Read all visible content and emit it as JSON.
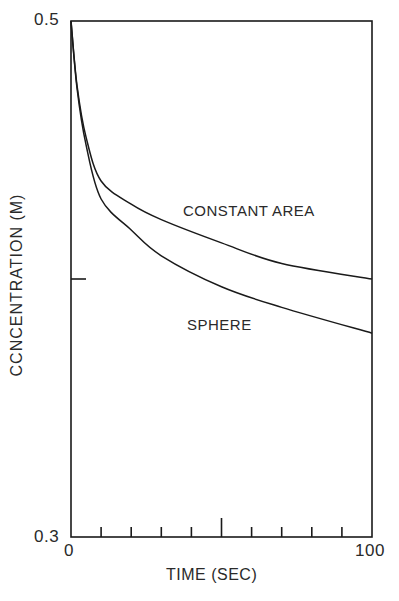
{
  "chart_data": {
    "type": "line",
    "title": "",
    "xlabel": "TIME (SEC)",
    "ylabel": "CCNCENTRATION (M)",
    "xlim": [
      0,
      100
    ],
    "ylim": [
      0.3,
      0.5
    ],
    "x_tick_labels": [
      "0",
      "100"
    ],
    "y_tick_labels": [
      "0.3",
      "0.5"
    ],
    "x_minor_ticks": [
      10,
      20,
      30,
      40,
      50,
      60,
      70,
      80,
      90
    ],
    "y_minor_ticks": [
      0.4
    ],
    "grid": false,
    "legend": "inline annotations",
    "x": [
      0,
      2,
      5,
      10,
      20,
      30,
      50,
      70,
      100
    ],
    "series": [
      {
        "name": "CONSTANT AREA",
        "values": [
          0.5,
          0.475,
          0.455,
          0.438,
          0.429,
          0.423,
          0.414,
          0.406,
          0.4
        ]
      },
      {
        "name": "SPHERE",
        "values": [
          0.5,
          0.474,
          0.452,
          0.431,
          0.419,
          0.409,
          0.397,
          0.389,
          0.379
        ]
      }
    ],
    "annotations": [
      {
        "text": "CONSTANT AREA",
        "x": 62,
        "y": 0.428
      },
      {
        "text": "SPHERE",
        "x": 40,
        "y": 0.392
      }
    ]
  },
  "labels": {
    "y_top": "0.5",
    "y_bottom": "0.3",
    "x_left": "0",
    "x_right": "100",
    "x_axis": "TIME (SEC)",
    "y_axis": "CCNCENTRATION (M)",
    "series_a": "CONSTANT AREA",
    "series_b": "SPHERE"
  }
}
